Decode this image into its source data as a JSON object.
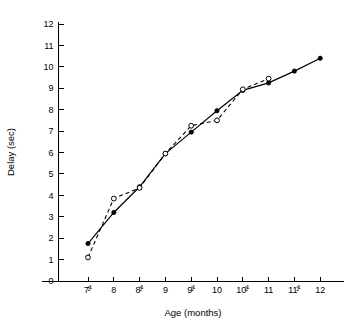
{
  "chart_data": {
    "type": "line",
    "title": "",
    "subtitle": "",
    "xlabel": "Age (months)",
    "ylabel": "Delay (sec)",
    "x": [
      7.5,
      8,
      8.5,
      9,
      9.5,
      10,
      10.5,
      11,
      11.5,
      12
    ],
    "xtick_labels": [
      "7½",
      "8",
      "8½",
      "9",
      "9½",
      "10",
      "10½",
      "11",
      "11½",
      "12"
    ],
    "xtick_parts": [
      {
        "main": "7",
        "num": "1",
        "den": "2"
      },
      {
        "main": "8",
        "num": "",
        "den": ""
      },
      {
        "main": "8",
        "num": "1",
        "den": "2"
      },
      {
        "main": "9",
        "num": "",
        "den": ""
      },
      {
        "main": "9",
        "num": "1",
        "den": "2"
      },
      {
        "main": "10",
        "num": "",
        "den": ""
      },
      {
        "main": "10",
        "num": "1",
        "den": "2"
      },
      {
        "main": "11",
        "num": "",
        "den": ""
      },
      {
        "main": "11",
        "num": "1",
        "den": "2"
      },
      {
        "main": "12",
        "num": "",
        "den": ""
      }
    ],
    "ytick_labels": [
      "0",
      "1",
      "2",
      "3",
      "4",
      "5",
      "6",
      "7",
      "8",
      "9",
      "10",
      "11",
      "12"
    ],
    "ytick_values": [
      0,
      1,
      2,
      3,
      4,
      5,
      6,
      7,
      8,
      9,
      10,
      11,
      12
    ],
    "xlim": [
      7.25,
      12.25
    ],
    "ylim": [
      0,
      12.4
    ],
    "grid": false,
    "legend_position": "none",
    "line_color": "#000000",
    "background_color": "#ffffff",
    "series": [
      {
        "name": "solid-filled-circles",
        "marker": "filled-circle",
        "line_style": "solid",
        "x": [
          7.5,
          8,
          8.5,
          9,
          9.5,
          10,
          10.5,
          11,
          11.5,
          12
        ],
        "values": [
          1.75,
          3.2,
          4.4,
          5.95,
          6.95,
          7.95,
          8.9,
          9.25,
          9.8,
          10.4
        ]
      },
      {
        "name": "dashed-open-circles",
        "marker": "open-circle",
        "line_style": "dashed",
        "x": [
          7.5,
          8,
          8.5,
          9,
          9.5,
          10,
          10.5,
          11
        ],
        "values": [
          1.1,
          3.85,
          4.35,
          5.95,
          7.25,
          7.5,
          8.95,
          9.45
        ]
      }
    ]
  }
}
